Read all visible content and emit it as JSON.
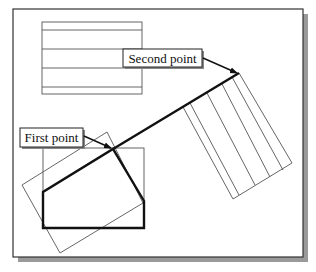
{
  "diagram": {
    "frame": {
      "x": 13,
      "y": 9,
      "width": 290,
      "height": 248,
      "shadow_offset": 5,
      "shadow_color": "#9a9a9a",
      "stroke": "#333333"
    },
    "labels": {
      "second_point": "Second point",
      "first_point": "First point"
    },
    "colors": {
      "thin_line": "#555555",
      "thick_line": "#111111",
      "background": "#ffffff"
    }
  }
}
